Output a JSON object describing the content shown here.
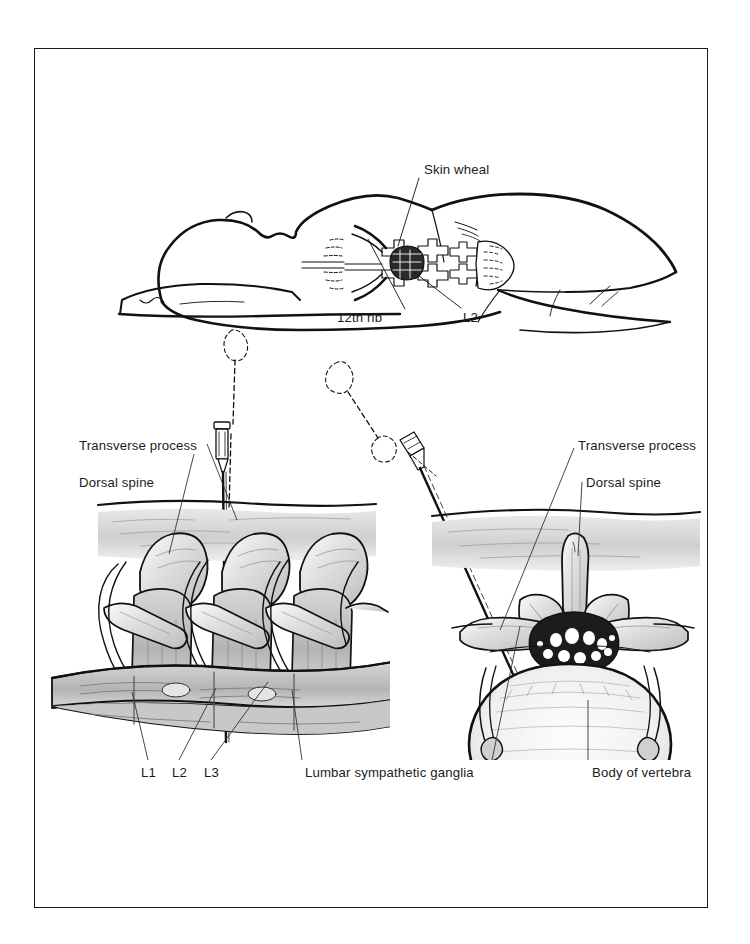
{
  "figure": {
    "border_color": "#1a1a1a",
    "ink_color": "#1b1b1b",
    "background": "#ffffff"
  },
  "panels": {
    "top": {
      "name": "patient-prone-surface-anatomy",
      "description": "Prone patient with head on pillow, surface landmarks of lumbar spine, 12th rib and sacrum",
      "labels": {
        "skin_wheal": "Skin wheal",
        "twelfth_rib": "12th rib",
        "l2": "L2"
      }
    },
    "bottom_left": {
      "name": "posterior-oblique-lumbar-spine",
      "description": "Posterior view of lumbar vertebrae showing needle passing alongside dorsal spine to sympathetic chain",
      "labels": {
        "transverse_process": "Transverse process",
        "dorsal_spine": "Dorsal spine",
        "l1": "L1",
        "l2": "L2",
        "l3": "L3",
        "ganglia": "Lumbar sympathetic ganglia"
      }
    },
    "bottom_right": {
      "name": "axial-cross-section-vertebra",
      "description": "Axial cross section of lumbar vertebra with needle approaching anterolateral body",
      "labels": {
        "transverse_process": "Transverse process",
        "dorsal_spine": "Dorsal spine",
        "body_of_vertebra": "Body of vertebra"
      }
    }
  },
  "icons": {
    "needle_left": "syringe-needle-icon",
    "needle_right": "syringe-needle-icon",
    "dashed_trajectory": "dashed-trajectory-icon"
  }
}
